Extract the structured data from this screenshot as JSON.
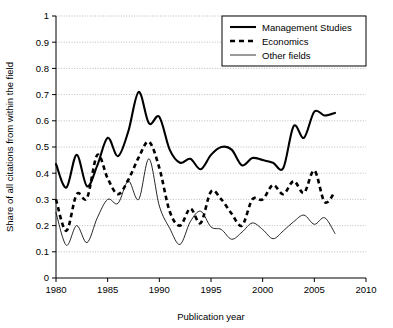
{
  "chart_data": {
    "type": "line",
    "title": "",
    "xlabel": "Publication year",
    "ylabel": "Share of all citations from within the field",
    "xlim": [
      1980,
      2010
    ],
    "ylim": [
      0,
      1
    ],
    "grid": "horizontal-dotted",
    "legend_position": "top-right",
    "xticks": [
      1980,
      1985,
      1990,
      1995,
      2000,
      2005,
      2010
    ],
    "xtick_labels": [
      "1980",
      "1985",
      "1990",
      "1995",
      "2000",
      "2005",
      "2010"
    ],
    "yticks": [
      0,
      0.1,
      0.2,
      0.3,
      0.4,
      0.5,
      0.6,
      0.7,
      0.8,
      0.9,
      1
    ],
    "ytick_labels": [
      "0",
      "0.1",
      "0.2",
      "0.3",
      "0.4",
      "0.5",
      "0.6",
      "0.7",
      "0.8",
      "0.9",
      "1"
    ],
    "x": [
      1980,
      1981,
      1982,
      1983,
      1984,
      1985,
      1986,
      1987,
      1988,
      1989,
      1990,
      1991,
      1992,
      1993,
      1994,
      1995,
      1996,
      1997,
      1998,
      1999,
      2000,
      2001,
      2002,
      2003,
      2004,
      2005,
      2006,
      2007
    ],
    "series": [
      {
        "name": "Management Studies",
        "style": "thick-solid",
        "color": "#000000",
        "values": [
          0.435,
          0.345,
          0.47,
          0.35,
          0.43,
          0.535,
          0.465,
          0.56,
          0.71,
          0.59,
          0.615,
          0.49,
          0.44,
          0.455,
          0.415,
          0.47,
          0.5,
          0.49,
          0.43,
          0.458,
          0.45,
          0.44,
          0.42,
          0.58,
          0.535,
          0.635,
          0.62,
          0.63
        ]
      },
      {
        "name": "Economics",
        "style": "thick-dashed",
        "color": "#000000",
        "values": [
          0.3,
          0.18,
          0.32,
          0.305,
          0.47,
          0.38,
          0.32,
          0.375,
          0.46,
          0.52,
          0.42,
          0.255,
          0.2,
          0.265,
          0.21,
          0.33,
          0.3,
          0.245,
          0.2,
          0.3,
          0.3,
          0.355,
          0.32,
          0.37,
          0.325,
          0.41,
          0.29,
          0.33
        ]
      },
      {
        "name": "Other fields",
        "style": "thin-solid",
        "color": "#000000",
        "values": [
          0.25,
          0.125,
          0.2,
          0.135,
          0.23,
          0.3,
          0.285,
          0.37,
          0.3,
          0.455,
          0.275,
          0.19,
          0.128,
          0.215,
          0.255,
          0.195,
          0.185,
          0.148,
          0.175,
          0.21,
          0.185,
          0.15,
          0.18,
          0.215,
          0.24,
          0.205,
          0.23,
          0.17
        ]
      }
    ]
  },
  "legend": {
    "items": [
      {
        "label": "Management Studies"
      },
      {
        "label": "Economics"
      },
      {
        "label": "Other fields"
      }
    ]
  }
}
